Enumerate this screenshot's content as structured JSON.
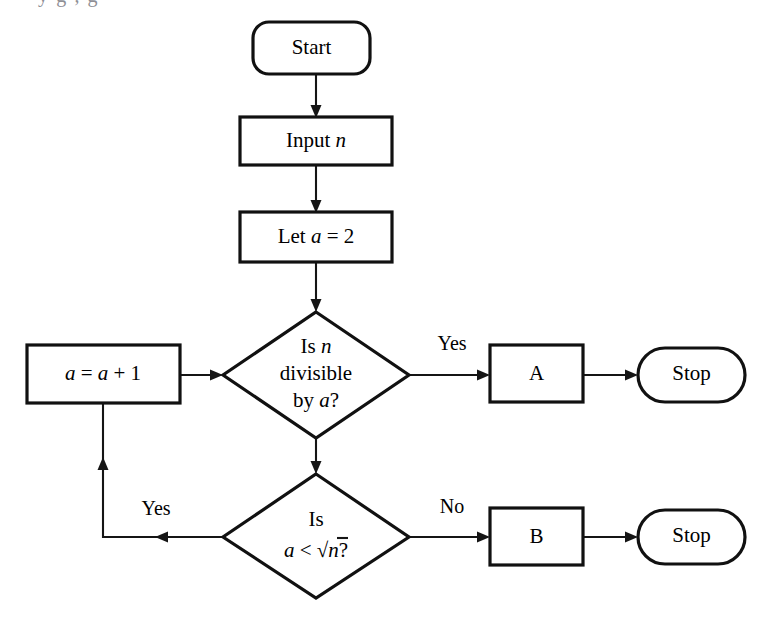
{
  "diagram": {
    "type": "flowchart",
    "background_color": "#ffffff",
    "line_color": "#151515",
    "text_color": "#000000",
    "partial_top_text": "y                 g        ,                                        g",
    "nodes": [
      {
        "id": "start",
        "shape": "terminator-rounded",
        "label": "Start",
        "x": 253,
        "y": 22,
        "w": 117,
        "h": 52
      },
      {
        "id": "input-n",
        "shape": "process",
        "label_prefix": "Input ",
        "label_italic": "n",
        "label": "Input n",
        "x": 240,
        "y": 117,
        "w": 152,
        "h": 48
      },
      {
        "id": "let-a-2",
        "shape": "process",
        "label_prefix": "Let ",
        "label_italic": "a",
        "label_suffix": " = 2",
        "label": "Let a = 2",
        "x": 240,
        "y": 212,
        "w": 152,
        "h": 50
      },
      {
        "id": "decision-divisible",
        "shape": "decision",
        "label_line1_prefix": "Is ",
        "label_line1_italic": "n",
        "label_line2": "divisible",
        "label_line3_prefix": "by ",
        "label_line3_italic": "a",
        "label_line3_suffix": "?",
        "label": "Is n divisible by a?",
        "cx": 316,
        "cy": 375,
        "rx": 93,
        "ry": 63
      },
      {
        "id": "increment-a",
        "shape": "process",
        "label_italic1": "a",
        "label_mid": " = ",
        "label_italic2": "a",
        "label_suffix": " + 1",
        "label": "a = a + 1",
        "x": 27,
        "y": 345,
        "w": 153,
        "h": 58
      },
      {
        "id": "box-a",
        "shape": "process",
        "label": "A",
        "x": 490,
        "y": 345,
        "w": 93,
        "h": 57
      },
      {
        "id": "stop-a",
        "shape": "terminator-stadium",
        "label": "Stop",
        "x": 638,
        "y": 348,
        "w": 107,
        "h": 54
      },
      {
        "id": "decision-sqrt",
        "shape": "decision",
        "label_line1": "Is",
        "label_line2_italic1": "a",
        "label_line2_op": " < ",
        "label_line2_radical": "n",
        "label_line2_suffix": "?",
        "label": "Is a < sqrt(n)?",
        "cx": 316,
        "cy": 536,
        "rx": 93,
        "ry": 62
      },
      {
        "id": "box-b",
        "shape": "process",
        "label": "B",
        "x": 490,
        "y": 508,
        "w": 93,
        "h": 57
      },
      {
        "id": "stop-b",
        "shape": "terminator-stadium",
        "label": "Stop",
        "x": 638,
        "y": 510,
        "w": 107,
        "h": 54
      }
    ],
    "edge_labels": [
      {
        "id": "yes-divisible",
        "text": "Yes",
        "x": 452,
        "y": 350
      },
      {
        "id": "no-sqrt",
        "text": "No",
        "x": 452,
        "y": 513
      },
      {
        "id": "yes-sqrt",
        "text": "Yes",
        "x": 156,
        "y": 515
      }
    ],
    "edges": [
      {
        "from": "start",
        "to": "input-n",
        "label": ""
      },
      {
        "from": "input-n",
        "to": "let-a-2",
        "label": ""
      },
      {
        "from": "let-a-2",
        "to": "decision-divisible",
        "label": ""
      },
      {
        "from": "decision-divisible",
        "to": "box-a",
        "label": "Yes"
      },
      {
        "from": "box-a",
        "to": "stop-a",
        "label": ""
      },
      {
        "from": "decision-divisible",
        "to": "decision-sqrt",
        "label": ""
      },
      {
        "from": "decision-sqrt",
        "to": "box-b",
        "label": "No"
      },
      {
        "from": "box-b",
        "to": "stop-b",
        "label": ""
      },
      {
        "from": "decision-sqrt",
        "to": "increment-a",
        "label": "Yes"
      },
      {
        "from": "increment-a",
        "to": "decision-divisible",
        "label": ""
      }
    ]
  }
}
